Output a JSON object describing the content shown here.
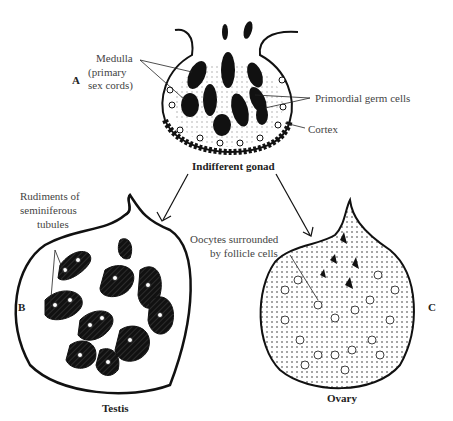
{
  "figure": {
    "panels": [
      {
        "letter": "A",
        "title": "Indifferent gonad",
        "labels": {
          "medulla_l1": "Medulla",
          "medulla_l2": "(primary",
          "medulla_l3": "sex cords)",
          "germ_cells": "Primordial germ cells",
          "cortex": "Cortex"
        }
      },
      {
        "letter": "B",
        "title": "Testis",
        "labels": {
          "rud_l1": "Rudiments of",
          "rud_l2": "seminiferous",
          "rud_l3": "tubules"
        }
      },
      {
        "letter": "C",
        "title": "Ovary",
        "labels": {
          "ooc_l1": "Oocytes surrounded",
          "ooc_l2": "by follicle cells"
        }
      }
    ],
    "colors": {
      "ink": "#1a1a1a",
      "label": "#444444",
      "background": "#ffffff"
    }
  }
}
